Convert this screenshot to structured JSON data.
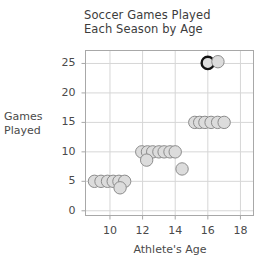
{
  "chart_data": {
    "type": "scatter",
    "title_line1": "Soccer Games Played",
    "title_line2": "Each Season by Age",
    "xlabel": "Athlete's Age",
    "ylabel": "Games\nPlayed",
    "ylabel_line1": "Games",
    "ylabel_line2": "Played",
    "xlim": [
      8.5,
      18.8
    ],
    "ylim": [
      -0.8,
      27.2
    ],
    "xticks": [
      10,
      12,
      14,
      16,
      18
    ],
    "yticks": [
      0,
      5,
      10,
      15,
      20,
      25
    ],
    "xtick_labels": [
      "10",
      "12",
      "14",
      "16",
      "18"
    ],
    "ytick_labels": [
      "0",
      "5",
      "10",
      "15",
      "20",
      "25"
    ],
    "grid": true,
    "legend": "none",
    "marker": "circle",
    "marker_fill": "#dcdcdc",
    "marker_stroke": "#8c8c8c",
    "highlight_stroke": "#111111",
    "grid_color": "#d6d6d6",
    "frame_color": "#a8a8a8",
    "points": [
      {
        "x": 9.05,
        "y": 5.0,
        "highlight": false
      },
      {
        "x": 9.45,
        "y": 5.0,
        "highlight": false
      },
      {
        "x": 9.85,
        "y": 5.0,
        "highlight": false
      },
      {
        "x": 10.2,
        "y": 5.0,
        "highlight": false
      },
      {
        "x": 10.55,
        "y": 5.0,
        "highlight": false
      },
      {
        "x": 10.9,
        "y": 5.0,
        "highlight": false
      },
      {
        "x": 10.62,
        "y": 3.9,
        "highlight": false
      },
      {
        "x": 11.95,
        "y": 10.0,
        "highlight": false
      },
      {
        "x": 12.3,
        "y": 10.0,
        "highlight": false
      },
      {
        "x": 12.62,
        "y": 10.0,
        "highlight": false
      },
      {
        "x": 13.0,
        "y": 10.0,
        "highlight": false
      },
      {
        "x": 13.32,
        "y": 10.0,
        "highlight": false
      },
      {
        "x": 13.68,
        "y": 10.0,
        "highlight": false
      },
      {
        "x": 14.0,
        "y": 10.0,
        "highlight": false
      },
      {
        "x": 12.25,
        "y": 8.6,
        "highlight": false
      },
      {
        "x": 14.42,
        "y": 7.1,
        "highlight": false
      },
      {
        "x": 15.2,
        "y": 15.0,
        "highlight": false
      },
      {
        "x": 15.5,
        "y": 15.0,
        "highlight": false
      },
      {
        "x": 15.82,
        "y": 15.0,
        "highlight": false
      },
      {
        "x": 16.2,
        "y": 15.0,
        "highlight": false
      },
      {
        "x": 16.6,
        "y": 15.0,
        "highlight": false
      },
      {
        "x": 17.0,
        "y": 15.0,
        "highlight": false
      },
      {
        "x": 16.0,
        "y": 25.1,
        "highlight": true
      },
      {
        "x": 16.62,
        "y": 25.3,
        "highlight": false
      }
    ]
  }
}
